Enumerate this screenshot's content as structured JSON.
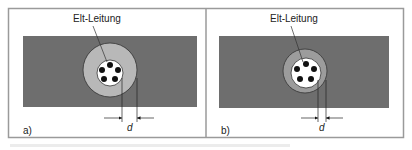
{
  "figure": {
    "panels": [
      {
        "id": "a",
        "panel_label": "a)",
        "cable_label": "Elt-Leitung",
        "dimension_label": "d",
        "colors": {
          "wall": "#6e6e6e",
          "sleeve": "#b8b8b8",
          "core": "#ffffff",
          "conductor": "#111111"
        }
      },
      {
        "id": "b",
        "panel_label": "b)",
        "cable_label": "Elt-Leitung",
        "dimension_label": "d",
        "colors": {
          "wall": "#6e6e6e",
          "sleeve": "#9c9c9c",
          "core": "#ffffff",
          "conductor": "#111111"
        }
      }
    ],
    "frame_color": "#9a9a9a"
  }
}
